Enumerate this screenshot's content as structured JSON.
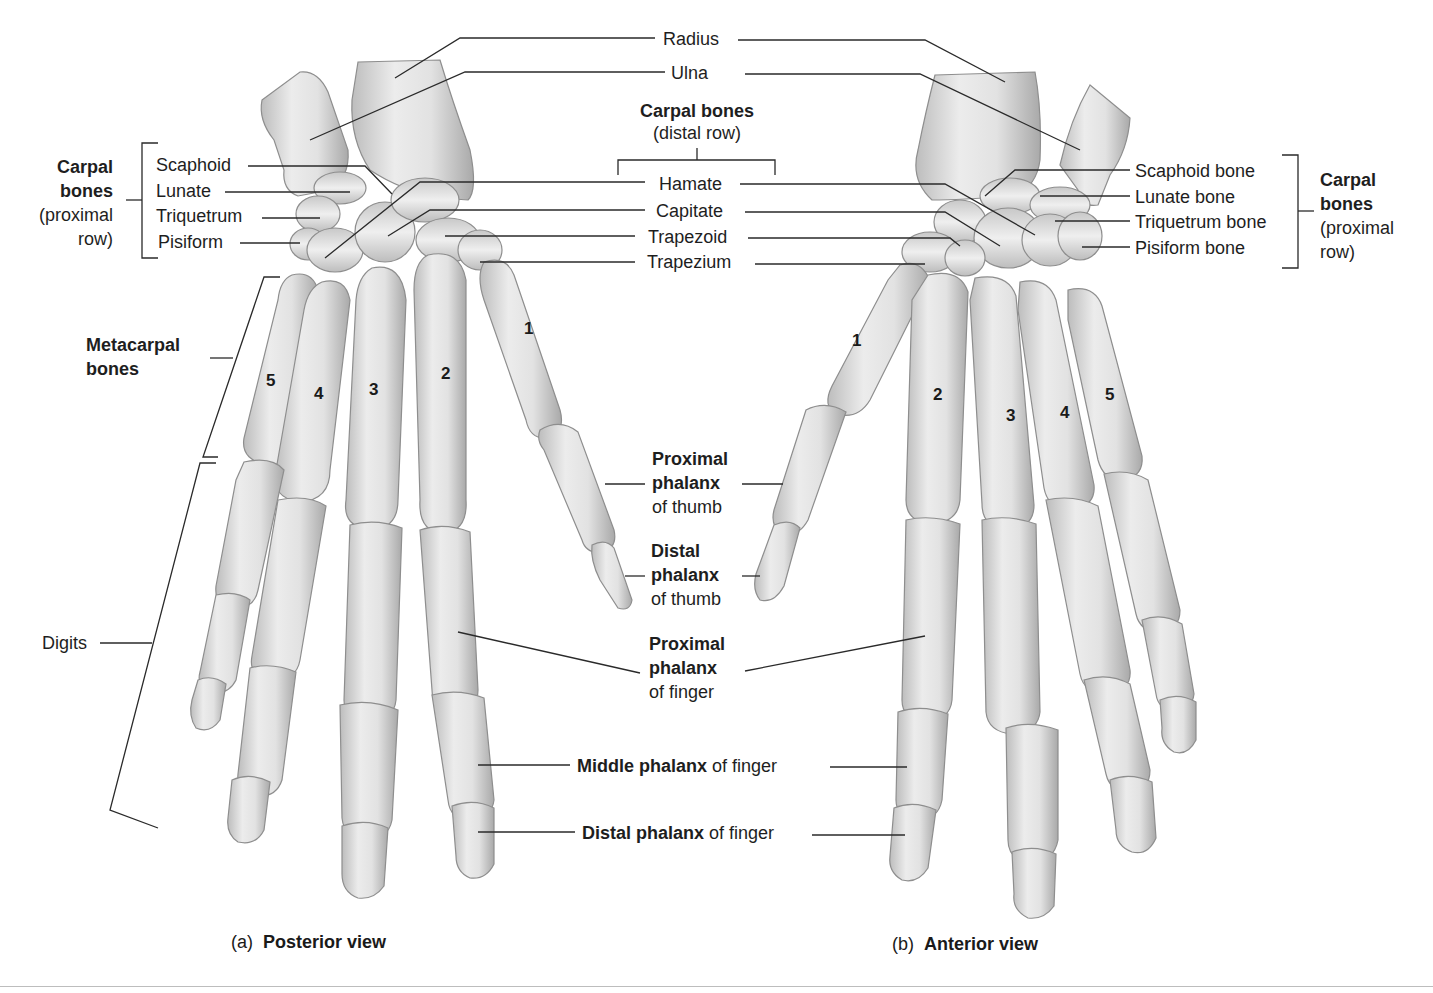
{
  "figure": {
    "top_labels": {
      "radius": "Radius",
      "ulna": "Ulna",
      "carpal_distal_title": "Carpal bones",
      "carpal_distal_sub": "(distal row)",
      "hamate": "Hamate",
      "capitate": "Capitate",
      "trapezoid": "Trapezoid",
      "trapezium": "Trapezium"
    },
    "left_carpal_group": {
      "title_line1": "Carpal",
      "title_line2": "bones",
      "sub_line1": "(proximal",
      "sub_line2": "row)",
      "items": [
        "Scaphoid",
        "Lunate",
        "Triquetrum",
        "Pisiform"
      ]
    },
    "right_carpal_group": {
      "title_line1": "Carpal",
      "title_line2": "bones",
      "sub_line1": "(proximal",
      "sub_line2": "row)",
      "items": [
        "Scaphoid bone",
        "Lunate bone",
        "Triquetrum bone",
        "Pisiform bone"
      ]
    },
    "left_side_labels": {
      "metacarpal_line1": "Metacarpal",
      "metacarpal_line2": "bones",
      "digits": "Digits"
    },
    "center_labels": {
      "prox_thumb_b1": "Proximal",
      "prox_thumb_b2": "phalanx",
      "prox_thumb_n": "of thumb",
      "dist_thumb_b1": "Distal",
      "dist_thumb_b2": "phalanx",
      "dist_thumb_n": "of thumb",
      "prox_finger_b1": "Proximal",
      "prox_finger_b2": "phalanx",
      "prox_finger_n": "of finger",
      "middle_finger_b": "Middle phalanx",
      "middle_finger_n": " of finger",
      "distal_finger_b": "Distal phalanx",
      "distal_finger_n": " of finger"
    },
    "metacarpal_numbers_posterior": [
      "1",
      "2",
      "3",
      "4",
      "5"
    ],
    "metacarpal_numbers_anterior": [
      "1",
      "2",
      "3",
      "4",
      "5"
    ],
    "captions": {
      "a_letter": "(a)",
      "a_title": "Posterior view",
      "b_letter": "(b)",
      "b_title": "Anterior view"
    },
    "colors": {
      "bone_fill": "#e4e4e4",
      "bone_shade": "#b9b9b9",
      "bone_outline": "#8a8a8a",
      "leader_line": "#2a2a2a",
      "text": "#1e1e1e"
    }
  }
}
